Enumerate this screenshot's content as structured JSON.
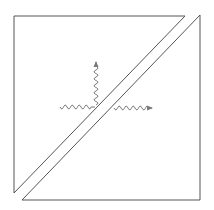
{
  "diagram": {
    "type": "beam-splitter",
    "colors": {
      "prism_stroke": "#555555",
      "wave_stroke": "#7a7a7a",
      "background": "#ffffff"
    },
    "prism_upper": {
      "points": "14,16 185,16 14,193"
    },
    "prism_lower": {
      "points": "200,15 200,200 22,200"
    },
    "waves": {
      "incident": {
        "direction": "right",
        "from": [
          60,
          107
        ],
        "to": [
          95,
          107
        ]
      },
      "reflected": {
        "direction": "up",
        "from": [
          96,
          105
        ],
        "to": [
          96,
          62
        ]
      },
      "transmitted": {
        "direction": "right",
        "from": [
          114,
          108
        ],
        "to": [
          152,
          108
        ]
      }
    }
  }
}
